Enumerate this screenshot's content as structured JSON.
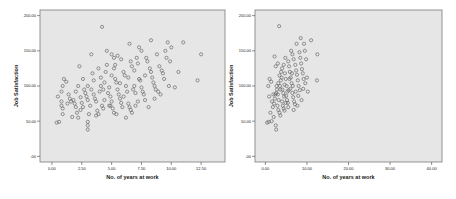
{
  "chart_data": [
    {
      "type": "scatter",
      "title": "",
      "xlabel": "No. of years at work",
      "ylabel": "Job Satisfaction",
      "xlim": [
        -1.0,
        14.5
      ],
      "ylim": [
        -8,
        208
      ],
      "x_ticks": [
        0.0,
        2.5,
        5.0,
        7.5,
        10.0,
        12.5
      ],
      "x_tick_labels": [
        "0.00",
        "2.50",
        "5.00",
        "7.50",
        "10.00",
        "12.50"
      ],
      "y_ticks": [
        0,
        50,
        100,
        150,
        200
      ],
      "y_tick_labels": [
        ".00",
        "50.00",
        "100.00",
        "150.00",
        "200.00"
      ],
      "grid": false,
      "legend": null,
      "background": "#e6e6e6",
      "marker_color": "#555555",
      "points": [
        [
          0.4,
          48
        ],
        [
          0.6,
          49
        ],
        [
          0.5,
          85
        ],
        [
          0.8,
          92
        ],
        [
          0.8,
          78
        ],
        [
          0.9,
          68
        ],
        [
          0.9,
          60
        ],
        [
          0.8,
          72
        ],
        [
          1.0,
          110
        ],
        [
          1.2,
          106
        ],
        [
          0.9,
          100
        ],
        [
          1.7,
          56
        ],
        [
          1.8,
          80
        ],
        [
          1.9,
          75
        ],
        [
          2.0,
          70
        ],
        [
          2.1,
          62
        ],
        [
          2.2,
          55
        ],
        [
          2.0,
          92
        ],
        [
          2.3,
          128
        ],
        [
          2.4,
          84
        ],
        [
          2.5,
          76
        ],
        [
          2.6,
          70
        ],
        [
          2.4,
          66
        ],
        [
          2.8,
          90
        ],
        [
          2.9,
          85
        ],
        [
          3.0,
          80
        ],
        [
          3.1,
          60
        ],
        [
          3.2,
          72
        ],
        [
          3.0,
          100
        ],
        [
          3.3,
          145
        ],
        [
          3.4,
          118
        ],
        [
          3.3,
          95
        ],
        [
          3.5,
          88
        ],
        [
          3.6,
          82
        ],
        [
          3.7,
          78
        ],
        [
          3.0,
          44
        ],
        [
          3.0,
          38
        ],
        [
          3.0,
          49
        ],
        [
          3.8,
          65
        ],
        [
          3.9,
          60
        ],
        [
          3.7,
          58
        ],
        [
          4.0,
          92
        ],
        [
          4.1,
          100
        ],
        [
          4.2,
          72
        ],
        [
          4.3,
          68
        ],
        [
          4.4,
          80
        ],
        [
          4.2,
          184
        ],
        [
          4.6,
          130
        ],
        [
          4.5,
          120
        ],
        [
          4.8,
          98
        ],
        [
          4.7,
          90
        ],
        [
          4.9,
          85
        ],
        [
          5.0,
          78
        ],
        [
          4.9,
          72
        ],
        [
          5.1,
          68
        ],
        [
          5.2,
          62
        ],
        [
          5.0,
          115
        ],
        [
          5.2,
          125
        ],
        [
          5.3,
          110
        ],
        [
          5.4,
          105
        ],
        [
          5.5,
          95
        ],
        [
          5.6,
          88
        ],
        [
          5.3,
          130
        ],
        [
          5.7,
          82
        ],
        [
          5.8,
          76
        ],
        [
          5.9,
          70
        ],
        [
          4.6,
          150
        ],
        [
          5.0,
          145
        ],
        [
          5.2,
          140
        ],
        [
          5.5,
          143
        ],
        [
          5.8,
          138
        ],
        [
          6.0,
          120
        ],
        [
          6.1,
          115
        ],
        [
          6.2,
          100
        ],
        [
          6.3,
          92
        ],
        [
          6.0,
          85
        ],
        [
          6.4,
          75
        ],
        [
          6.5,
          70
        ],
        [
          6.6,
          66
        ],
        [
          6.7,
          62
        ],
        [
          6.8,
          95
        ],
        [
          6.9,
          100
        ],
        [
          7.0,
          90
        ],
        [
          6.5,
          160
        ],
        [
          6.7,
          128
        ],
        [
          6.9,
          122
        ],
        [
          7.1,
          140
        ],
        [
          7.2,
          132
        ],
        [
          7.3,
          110
        ],
        [
          7.4,
          108
        ],
        [
          7.5,
          98
        ],
        [
          7.6,
          92
        ],
        [
          7.7,
          88
        ],
        [
          7.3,
          155
        ],
        [
          7.5,
          150
        ],
        [
          7.8,
          115
        ],
        [
          7.9,
          140
        ],
        [
          8.0,
          135
        ],
        [
          8.2,
          125
        ],
        [
          8.3,
          120
        ],
        [
          8.4,
          112
        ],
        [
          8.5,
          105
        ],
        [
          8.6,
          100
        ],
        [
          8.7,
          95
        ],
        [
          8.8,
          145
        ],
        [
          8.9,
          92
        ],
        [
          8.3,
          165
        ],
        [
          9.0,
          128
        ],
        [
          9.2,
          122
        ],
        [
          9.3,
          118
        ],
        [
          9.4,
          110
        ],
        [
          9.5,
          150
        ],
        [
          9.6,
          140
        ],
        [
          9.7,
          162
        ],
        [
          9.9,
          135
        ],
        [
          10.0,
          155
        ],
        [
          10.3,
          98
        ],
        [
          10.6,
          120
        ],
        [
          11.0,
          162
        ],
        [
          12.2,
          108
        ],
        [
          12.5,
          145
        ],
        [
          1.5,
          82
        ],
        [
          1.6,
          78
        ],
        [
          1.4,
          88
        ],
        [
          2.7,
          95
        ],
        [
          3.5,
          108
        ],
        [
          4.1,
          112
        ],
        [
          4.4,
          105
        ],
        [
          4.8,
          72
        ],
        [
          5.4,
          60
        ],
        [
          6.2,
          55
        ],
        [
          7.0,
          72
        ],
        [
          7.2,
          78
        ],
        [
          7.8,
          80
        ],
        [
          8.1,
          70
        ],
        [
          8.6,
          82
        ],
        [
          9.1,
          88
        ],
        [
          9.8,
          100
        ],
        [
          1.3,
          75
        ],
        [
          2.2,
          100
        ],
        [
          2.6,
          110
        ],
        [
          3.9,
          125
        ],
        [
          4.3,
          95
        ],
        [
          5.7,
          104
        ],
        [
          6.4,
          112
        ],
        [
          6.6,
          135
        ]
      ]
    },
    {
      "type": "scatter",
      "title": "",
      "xlabel": "No. of years at work",
      "ylabel": "Job Satisfaction",
      "xlim": [
        -2.5,
        42.5
      ],
      "ylim": [
        -8,
        208
      ],
      "x_ticks": [
        0,
        10,
        20,
        30,
        40
      ],
      "x_tick_labels": [
        "0.00",
        "10.00",
        "20.00",
        "30.00",
        "40.00"
      ],
      "y_ticks": [
        0,
        50,
        100,
        150,
        200
      ],
      "y_tick_labels": [
        ".00",
        "50.00",
        "100.00",
        "150.00",
        "200.00"
      ],
      "grid": false,
      "legend": null,
      "background": "#e6e6e6",
      "marker_color": "#555555",
      "points": [
        [
          0.4,
          48
        ],
        [
          0.8,
          49
        ],
        [
          1.5,
          50
        ],
        [
          2.5,
          44
        ],
        [
          2.6,
          38
        ],
        [
          2.0,
          56
        ],
        [
          1.2,
          62
        ],
        [
          0.9,
          85
        ],
        [
          1.0,
          110
        ],
        [
          1.4,
          106
        ],
        [
          0.7,
          100
        ],
        [
          1.8,
          70
        ],
        [
          2.1,
          75
        ],
        [
          2.3,
          82
        ],
        [
          2.6,
          90
        ],
        [
          2.8,
          95
        ],
        [
          3.0,
          88
        ],
        [
          3.2,
          80
        ],
        [
          2.9,
          72
        ],
        [
          3.1,
          66
        ],
        [
          3.4,
          62
        ],
        [
          3.6,
          58
        ],
        [
          3.3,
          185
        ],
        [
          3.5,
          100
        ],
        [
          3.7,
          108
        ],
        [
          3.9,
          112
        ],
        [
          4.1,
          95
        ],
        [
          4.3,
          90
        ],
        [
          4.5,
          85
        ],
        [
          4.0,
          78
        ],
        [
          4.2,
          72
        ],
        [
          4.4,
          68
        ],
        [
          4.6,
          65
        ],
        [
          3.8,
          120
        ],
        [
          4.0,
          125
        ],
        [
          4.4,
          130
        ],
        [
          4.7,
          118
        ],
        [
          4.9,
          110
        ],
        [
          5.1,
          100
        ],
        [
          5.3,
          92
        ],
        [
          5.0,
          86
        ],
        [
          5.2,
          80
        ],
        [
          5.4,
          76
        ],
        [
          2.2,
          142
        ],
        [
          2.5,
          128
        ],
        [
          3.0,
          132
        ],
        [
          4.8,
          140
        ],
        [
          5.5,
          135
        ],
        [
          5.7,
          128
        ],
        [
          5.9,
          120
        ],
        [
          6.1,
          112
        ],
        [
          6.3,
          104
        ],
        [
          6.0,
          96
        ],
        [
          6.5,
          90
        ],
        [
          6.7,
          84
        ],
        [
          6.9,
          78
        ],
        [
          7.1,
          74
        ],
        [
          6.2,
          150
        ],
        [
          6.5,
          145
        ],
        [
          6.8,
          138
        ],
        [
          7.2,
          130
        ],
        [
          7.4,
          122
        ],
        [
          7.6,
          116
        ],
        [
          7.8,
          108
        ],
        [
          8.0,
          100
        ],
        [
          7.5,
          160
        ],
        [
          8.2,
          148
        ],
        [
          8.4,
          140
        ],
        [
          8.6,
          132
        ],
        [
          8.8,
          124
        ],
        [
          9.0,
          118
        ],
        [
          9.2,
          110
        ],
        [
          8.5,
          168
        ],
        [
          9.5,
          150
        ],
        [
          9.3,
          160
        ],
        [
          9.8,
          138
        ],
        [
          10.0,
          112
        ],
        [
          10.2,
          92
        ],
        [
          11.0,
          165
        ],
        [
          12.5,
          145
        ],
        [
          12.4,
          108
        ],
        [
          1.6,
          78
        ],
        [
          1.9,
          88
        ],
        [
          2.7,
          100
        ],
        [
          3.4,
          115
        ],
        [
          4.6,
          102
        ],
        [
          5.6,
          94
        ],
        [
          6.6,
          100
        ],
        [
          7.3,
          92
        ],
        [
          7.9,
          86
        ],
        [
          8.7,
          80
        ],
        [
          9.1,
          96
        ],
        [
          9.6,
          104
        ],
        [
          5.8,
          110
        ],
        [
          6.4,
          118
        ],
        [
          3.6,
          95
        ],
        [
          4.9,
          76
        ],
        [
          5.5,
          70
        ],
        [
          6.8,
          66
        ],
        [
          7.7,
          72
        ],
        [
          8.3,
          94
        ],
        [
          2.4,
          88
        ],
        [
          3.1,
          104
        ]
      ]
    }
  ],
  "charts": [
    {
      "ylabel": "Job Satisfaction",
      "xlabel": "No. of years at work"
    },
    {
      "ylabel": "Job Satisfaction",
      "xlabel": "No. of years at work"
    }
  ]
}
